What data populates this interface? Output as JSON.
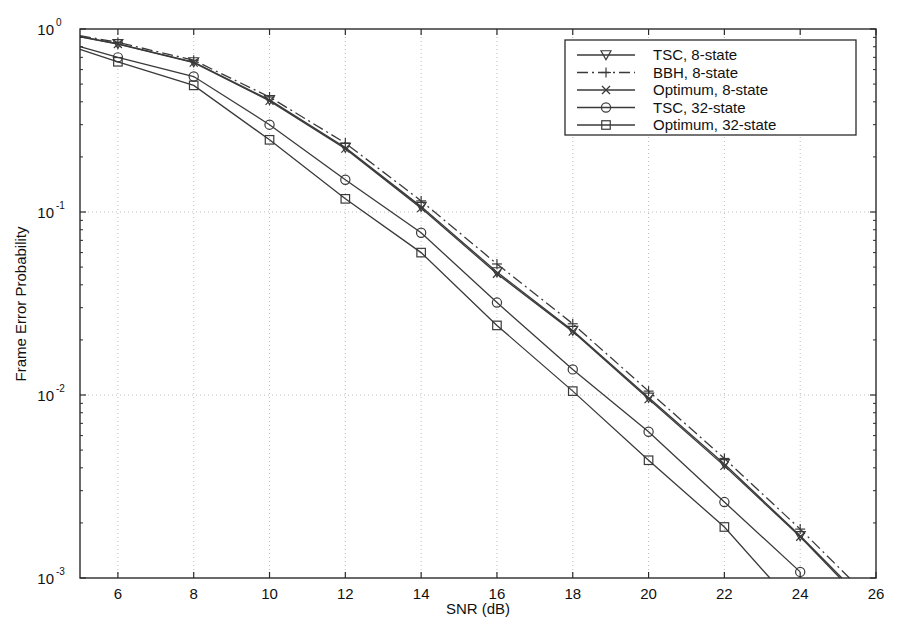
{
  "chart_data": {
    "type": "line",
    "title": "",
    "xlabel": "SNR (dB)",
    "ylabel": "Frame Error Probability",
    "xlim": [
      5,
      26
    ],
    "ylim": [
      0.001,
      1
    ],
    "yscale": "log",
    "grid": true,
    "legend_position": "top-right",
    "xticks": [
      6,
      8,
      10,
      12,
      14,
      16,
      18,
      20,
      22,
      24,
      26
    ],
    "xtick_labels": [
      "6",
      "8",
      "10",
      "12",
      "14",
      "16",
      "18",
      "20",
      "22",
      "24",
      "26"
    ],
    "yticks": [
      1,
      0.1,
      0.01,
      0.001
    ],
    "ytick_labels": [
      "10^0",
      "10^-1",
      "10^-2",
      "10^-3"
    ],
    "ytick_base": [
      "10",
      "10",
      "10",
      "10"
    ],
    "ytick_exp": [
      "0",
      "-1",
      "-2",
      "-3"
    ],
    "series": [
      {
        "name": "TSC, 8-state",
        "marker": "triangle-down",
        "linestyle": "solid",
        "color": "#3a3a3a",
        "x": [
          5,
          6,
          8,
          10,
          12,
          14,
          16,
          18,
          20,
          22,
          24,
          25.1
        ],
        "y": [
          0.91,
          0.83,
          0.66,
          0.41,
          0.225,
          0.107,
          0.047,
          0.0225,
          0.0097,
          0.0042,
          0.0017,
          0.001
        ]
      },
      {
        "name": "BBH, 8-state",
        "marker": "plus",
        "linestyle": "dashdot",
        "color": "#3a3a3a",
        "x": [
          5,
          6,
          8,
          10,
          12,
          14,
          16,
          18,
          20,
          22,
          24,
          25.3
        ],
        "y": [
          0.92,
          0.845,
          0.675,
          0.425,
          0.238,
          0.115,
          0.052,
          0.0245,
          0.0105,
          0.0045,
          0.00185,
          0.001
        ]
      },
      {
        "name": "Optimum, 8-state",
        "marker": "x",
        "linestyle": "solid",
        "color": "#3a3a3a",
        "x": [
          5,
          6,
          8,
          10,
          12,
          14,
          16,
          18,
          20,
          22,
          24,
          25.05
        ],
        "y": [
          0.905,
          0.828,
          0.655,
          0.405,
          0.222,
          0.105,
          0.046,
          0.0222,
          0.0095,
          0.0041,
          0.00168,
          0.001
        ]
      },
      {
        "name": "TSC, 32-state",
        "marker": "circle",
        "linestyle": "solid",
        "color": "#3a3a3a",
        "x": [
          5,
          6,
          8,
          10,
          12,
          14,
          16,
          18,
          20,
          22,
          24
        ],
        "y": [
          0.8,
          0.7,
          0.55,
          0.3,
          0.15,
          0.077,
          0.032,
          0.0138,
          0.0063,
          0.0026,
          0.00108
        ]
      },
      {
        "name": "Optimum, 32-state",
        "marker": "square",
        "linestyle": "solid",
        "color": "#3a3a3a",
        "x": [
          5,
          6,
          8,
          10,
          12,
          14,
          16,
          18,
          20,
          22,
          23.2
        ],
        "y": [
          0.775,
          0.662,
          0.492,
          0.248,
          0.118,
          0.06,
          0.024,
          0.0105,
          0.0044,
          0.0019,
          0.001
        ]
      }
    ]
  },
  "legend": {
    "entries": [
      {
        "label": "TSC, 8-state",
        "marker": "triangle-down",
        "linestyle": "solid"
      },
      {
        "label": "BBH, 8-state",
        "marker": "plus",
        "linestyle": "dashdot"
      },
      {
        "label": "Optimum, 8-state",
        "marker": "x",
        "linestyle": "solid"
      },
      {
        "label": "TSC, 32-state",
        "marker": "circle",
        "linestyle": "solid"
      },
      {
        "label": "Optimum, 32-state",
        "marker": "square",
        "linestyle": "solid"
      }
    ]
  },
  "colors": {
    "line": "#3a3a3a",
    "axis": "#2b2b2b",
    "grid": "#bdbdbd",
    "background": "#ffffff"
  }
}
